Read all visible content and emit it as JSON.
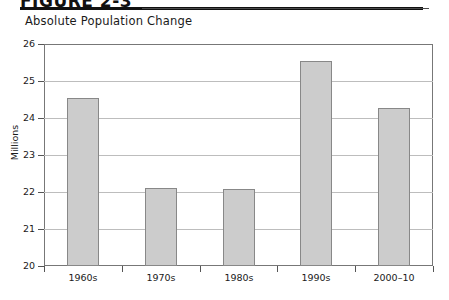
{
  "figure": {
    "heading": "FIGURE 2-3",
    "subtitle": "Absolute Population Change"
  },
  "chart_data": {
    "type": "bar",
    "title": "Absolute Population Change",
    "xlabel": "",
    "ylabel": "Millions",
    "categories": [
      "1960s",
      "1970s",
      "1980s",
      "1990s",
      "2000–10"
    ],
    "values": [
      24.53,
      22.12,
      22.07,
      25.55,
      24.28
    ],
    "ylim": [
      20,
      26
    ],
    "yticks": [
      20,
      21,
      22,
      23,
      24,
      25,
      26
    ],
    "ytick_labels": [
      "20",
      "21",
      "22",
      "23",
      "24",
      "25",
      "26"
    ],
    "grid": true,
    "legend": "none",
    "bar_fill": "#cccccc",
    "bar_border": "#888888",
    "gridline_color": "#bdbdbd",
    "axis_color": "#777777"
  }
}
